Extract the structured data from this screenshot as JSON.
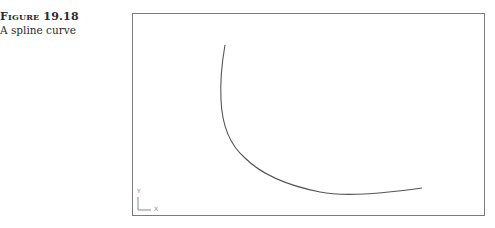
{
  "caption": {
    "figure_label": "Figure 19.18",
    "title": "A spline curve"
  },
  "drawing": {
    "frame_color": "#7a7a7a",
    "curve_color": "#555555",
    "curve_type": "spline",
    "ucs_icon": {
      "x_label": "X",
      "y_label": "Y"
    }
  }
}
